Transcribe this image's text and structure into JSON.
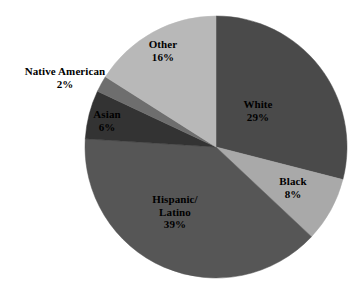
{
  "chart_data": {
    "type": "pie",
    "title": "",
    "subtitle": "",
    "xlabel": "",
    "ylabel": "",
    "legend_position": "none",
    "grid": false,
    "units": "percent",
    "start_angle_deg": 0,
    "direction": "clockwise",
    "categories": [
      "White",
      "Black",
      "Hispanic/Latino",
      "Asian",
      "Native American",
      "Other"
    ],
    "values": [
      29,
      8,
      39,
      6,
      2,
      16
    ],
    "slices": [
      {
        "label": "White",
        "label_lines": [
          "White"
        ],
        "value": 29,
        "value_text": "29%",
        "color": "#4a4a4a",
        "label_placement": "inside"
      },
      {
        "label": "Black",
        "label_lines": [
          "Black"
        ],
        "value": 8,
        "value_text": "8%",
        "color": "#a9a9a9",
        "label_placement": "inside"
      },
      {
        "label": "Hispanic/Latino",
        "label_lines": [
          "Hispanic/",
          "Latino"
        ],
        "value": 39,
        "value_text": "39%",
        "color": "#565656",
        "label_placement": "inside"
      },
      {
        "label": "Asian",
        "label_lines": [
          "Asian"
        ],
        "value": 6,
        "value_text": "6%",
        "color": "#333333",
        "label_placement": "inside"
      },
      {
        "label": "Native American",
        "label_lines": [
          "Native American"
        ],
        "value": 2,
        "value_text": "2%",
        "color": "#6e6e6e",
        "label_placement": "outside-left"
      },
      {
        "label": "Other",
        "label_lines": [
          "Other"
        ],
        "value": 16,
        "value_text": "16%",
        "color": "#b8b8b8",
        "label_placement": "inside"
      }
    ]
  },
  "labels": {
    "white": {
      "name": "White",
      "value": "29%"
    },
    "black": {
      "name": "Black",
      "value": "8%"
    },
    "hispanic": {
      "name_line1": "Hispanic/",
      "name_line2": "Latino",
      "value": "39%"
    },
    "asian": {
      "name": "Asian",
      "value": "6%"
    },
    "native": {
      "name": "Native American",
      "value": "2%"
    },
    "other": {
      "name": "Other",
      "value": "16%"
    }
  },
  "geometry": {
    "center_x": 216,
    "center_y": 147,
    "radius": 131
  }
}
